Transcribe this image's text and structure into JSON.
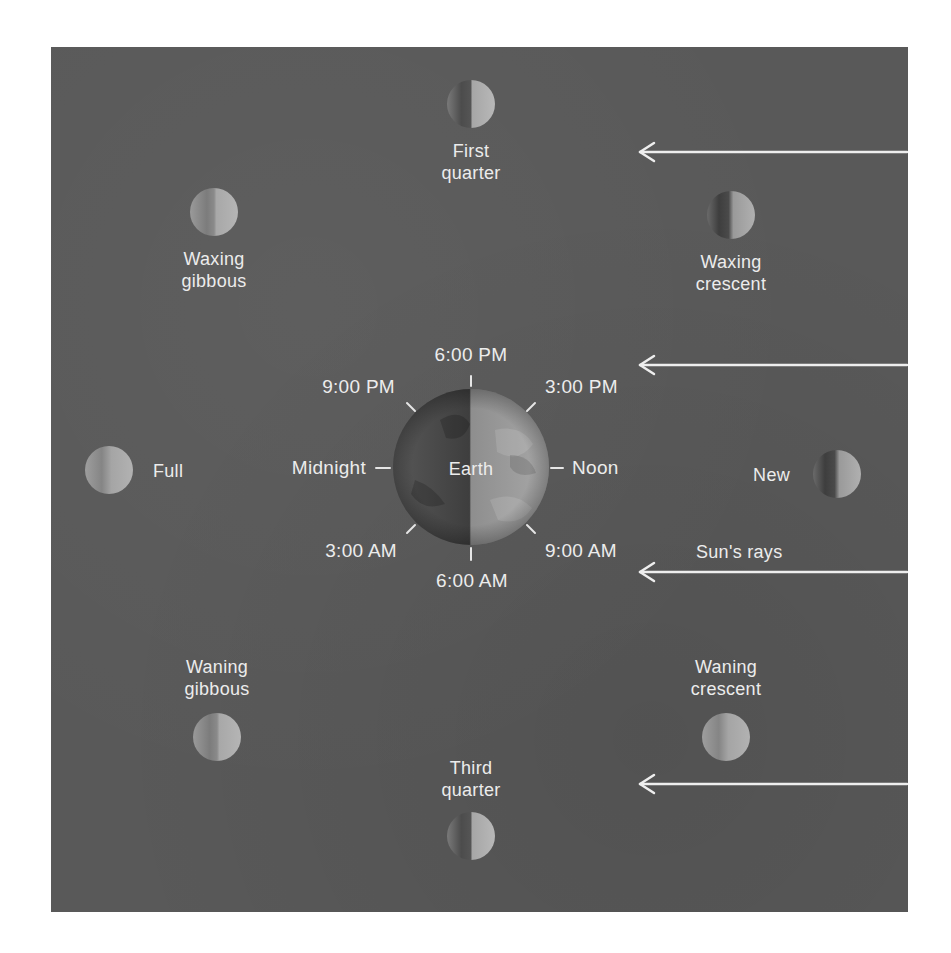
{
  "diagram": {
    "colors": {
      "panel": "#595959",
      "text": "#ececec",
      "arrow": "#eeeeee",
      "dark_side": "#4a4a4a",
      "lit_side": "#b0b0b0"
    },
    "earth": {
      "label": "Earth",
      "cx": 471,
      "cy": 467,
      "r": 78
    },
    "times": {
      "t1800": "6:00 PM",
      "t2100": "9:00 PM",
      "t1500": "3:00 PM",
      "midnight": "Midnight",
      "noon": "Noon",
      "t0300": "3:00 AM",
      "t0900": "9:00 AM",
      "t0600": "6:00 AM"
    },
    "phases": {
      "first_quarter": {
        "line1": "First",
        "line2": "quarter",
        "cx": 471,
        "cy": 104
      },
      "waxing_gibbous": {
        "line1": "Waxing",
        "line2": "gibbous",
        "cx": 214,
        "cy": 212
      },
      "waxing_crescent": {
        "line1": "Waxing",
        "line2": "crescent",
        "cx": 731,
        "cy": 215
      },
      "full": {
        "label": "Full",
        "cx": 109,
        "cy": 470
      },
      "new": {
        "label": "New",
        "cx": 837,
        "cy": 474
      },
      "waning_gibbous": {
        "line1": "Waning",
        "line2": "gibbous",
        "cx": 217,
        "cy": 737
      },
      "waning_crescent": {
        "line1": "Waning",
        "line2": "crescent",
        "cx": 726,
        "cy": 737
      },
      "third_quarter": {
        "line1": "Third",
        "line2": "quarter",
        "cx": 471,
        "cy": 836
      }
    },
    "sun_rays": {
      "label": "Sun's rays",
      "arrow_y": [
        152,
        365,
        572,
        784
      ],
      "arrow_tip_x": 638,
      "arrow_end_x": 907
    }
  }
}
